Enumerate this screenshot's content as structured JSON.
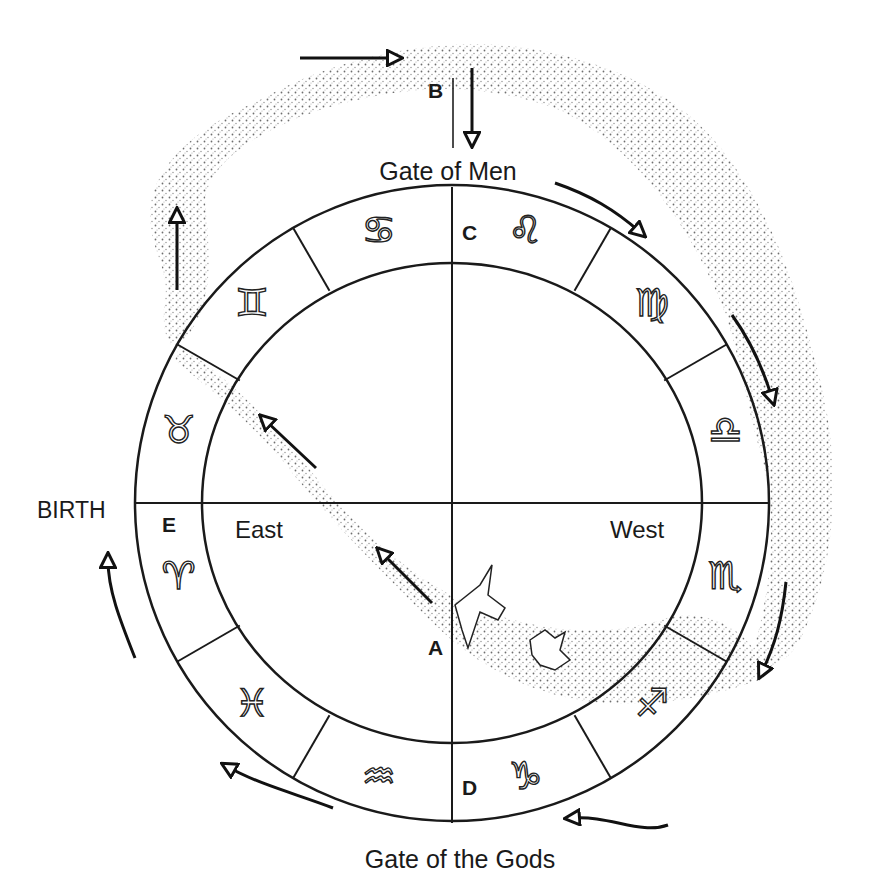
{
  "diagram": {
    "title_top": "Gate of Men",
    "title_bottom": "Gate of the Gods",
    "left_label": "BIRTH",
    "inner_labels": {
      "east": "East",
      "west": "West"
    },
    "points": {
      "A": "A",
      "B": "B",
      "C": "C",
      "D": "D",
      "E": "E"
    },
    "zodiac": [
      {
        "name": "Leo",
        "glyph": "♌"
      },
      {
        "name": "Virgo",
        "glyph": "♍"
      },
      {
        "name": "Libra",
        "glyph": "♎"
      },
      {
        "name": "Scorpio",
        "glyph": "♏"
      },
      {
        "name": "Sagittarius",
        "glyph": "♐"
      },
      {
        "name": "Capricorn",
        "glyph": "♑"
      },
      {
        "name": "Aquarius",
        "glyph": "♒"
      },
      {
        "name": "Pisces",
        "glyph": "♓"
      },
      {
        "name": "Aries",
        "glyph": "♈"
      },
      {
        "name": "Taurus",
        "glyph": "♉"
      },
      {
        "name": "Gemini",
        "glyph": "♊"
      },
      {
        "name": "Cancer",
        "glyph": "♋"
      }
    ],
    "colors": {
      "ink": "#1a1a1a",
      "stipple": "#555555",
      "background": "#ffffff"
    }
  }
}
